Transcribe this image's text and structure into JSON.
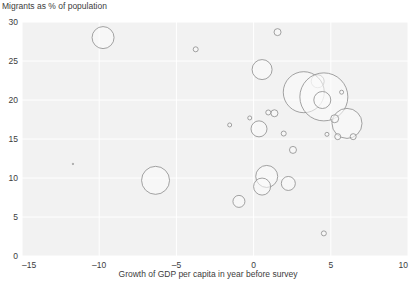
{
  "chart_data": {
    "type": "scatter",
    "title": "",
    "ylabel": "Migrants as % of population",
    "xlabel": "Growth of GDP per capita in year before survey",
    "xlim": [
      -15,
      10
    ],
    "ylim": [
      0,
      30
    ],
    "xticks": [
      "–15",
      "–10",
      "–5",
      "0",
      "5",
      "10"
    ],
    "xtick_values": [
      -15,
      -10,
      -5,
      0,
      5,
      10
    ],
    "yticks": [
      "0",
      "5",
      "10",
      "15",
      "20",
      "25",
      "30"
    ],
    "ytick_values": [
      0,
      5,
      10,
      15,
      20,
      25,
      30
    ],
    "grid": true,
    "legend": "none",
    "size_encoding": "bubble area (unlabelled magnitude)",
    "points": [
      {
        "x": -9.75,
        "y": 28.0,
        "r": 11.0
      },
      {
        "x": -3.75,
        "y": 26.5,
        "r": 2.5
      },
      {
        "x": 1.55,
        "y": 28.7,
        "r": 3.5
      },
      {
        "x": 0.55,
        "y": 23.9,
        "r": 10.0
      },
      {
        "x": 4.15,
        "y": 22.4,
        "r": 6.5
      },
      {
        "x": 3.25,
        "y": 21.0,
        "r": 20.5
      },
      {
        "x": 4.55,
        "y": 20.4,
        "r": 24.0
      },
      {
        "x": 4.45,
        "y": 20.0,
        "r": 8.5
      },
      {
        "x": 5.7,
        "y": 21.0,
        "r": 2.0
      },
      {
        "x": 0.95,
        "y": 18.4,
        "r": 2.5
      },
      {
        "x": 1.35,
        "y": 18.3,
        "r": 3.5
      },
      {
        "x": -0.25,
        "y": 17.7,
        "r": 2.0
      },
      {
        "x": -1.55,
        "y": 16.8,
        "r": 2.0
      },
      {
        "x": 0.35,
        "y": 16.3,
        "r": 8.0
      },
      {
        "x": 6.05,
        "y": 17.0,
        "r": 15.0
      },
      {
        "x": 5.25,
        "y": 17.6,
        "r": 4.0
      },
      {
        "x": 1.95,
        "y": 15.7,
        "r": 2.5
      },
      {
        "x": 4.75,
        "y": 15.6,
        "r": 2.0
      },
      {
        "x": 5.45,
        "y": 15.3,
        "r": 3.0
      },
      {
        "x": 6.45,
        "y": 15.3,
        "r": 3.0
      },
      {
        "x": 2.55,
        "y": 13.6,
        "r": 3.5
      },
      {
        "x": -6.35,
        "y": 9.7,
        "r": 14.0
      },
      {
        "x": 0.85,
        "y": 10.2,
        "r": 11.0
      },
      {
        "x": 0.55,
        "y": 8.9,
        "r": 8.5
      },
      {
        "x": 2.25,
        "y": 9.3,
        "r": 7.0
      },
      {
        "x": -0.95,
        "y": 7.0,
        "r": 6.0
      },
      {
        "x": 4.55,
        "y": 2.9,
        "r": 2.5
      },
      {
        "x": -11.7,
        "y": 11.8,
        "r": 0.7
      }
    ]
  },
  "labels": {
    "y_axis_caption": "Migrants as % of population",
    "x_axis_caption": "Growth of GDP per capita in year before survey"
  }
}
